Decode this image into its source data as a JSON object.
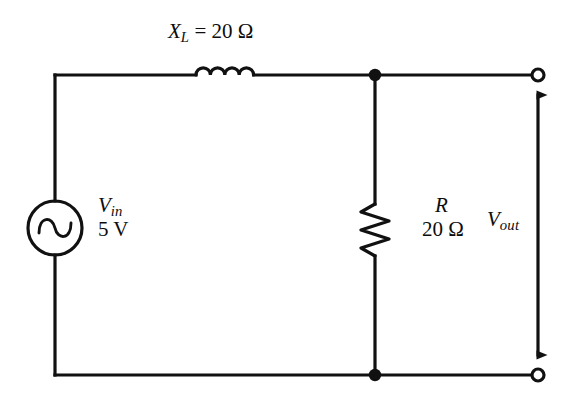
{
  "diagram": {
    "stroke_color": "#111111",
    "background_color": "#ffffff"
  },
  "components": {
    "source": {
      "name": "ac-voltage-source",
      "symbol": "sine-circle",
      "label_name": "V",
      "label_subscript": "in",
      "value": "5 V"
    },
    "inductor": {
      "name": "inductor",
      "symbol": "coil",
      "label_name": "X",
      "label_subscript": "L",
      "equals": "=",
      "value": "20",
      "unit": "Ω"
    },
    "resistor": {
      "name": "resistor",
      "symbol": "zigzag",
      "label_name": "R",
      "value": "20",
      "unit": "Ω"
    },
    "output": {
      "name": "output-port",
      "label_name": "V",
      "label_subscript": "out",
      "arrow": "double-headed-vertical"
    }
  },
  "nodes": {
    "junction_top": "node-top",
    "junction_bottom": "node-bottom",
    "terminal_top": "terminal-top-right",
    "terminal_bottom": "terminal-bottom-right"
  }
}
